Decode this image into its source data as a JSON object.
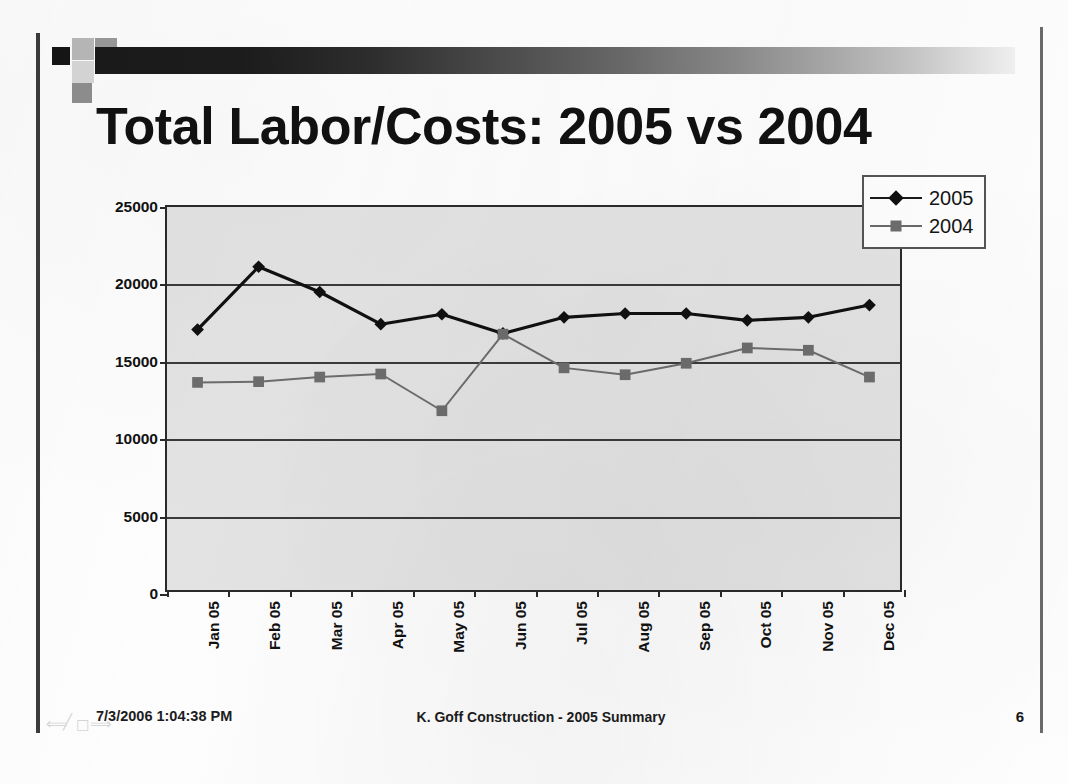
{
  "slide": {
    "title": "Total Labor/Costs: 2005 vs 2004",
    "page_number": "6"
  },
  "footer": {
    "timestamp": "7/3/2006 1:04:38 PM",
    "center_text": "K. Goff Construction - 2005 Summary",
    "nav_icons": [
      "back-arrow-icon",
      "pen-icon",
      "slide-menu-icon",
      "forward-arrow-icon"
    ]
  },
  "legend": {
    "position": "right",
    "entries": [
      {
        "label": "2005",
        "marker": "diamond",
        "color": "#101010"
      },
      {
        "label": "2004",
        "marker": "square",
        "color": "#6d6d6d"
      }
    ]
  },
  "colors": {
    "plot_background": "#e3e3e3",
    "axis": "#2a2a2a",
    "gridline": "#3a3a3a",
    "series_2005": "#101010",
    "series_2004": "#6d6d6d",
    "title": "#111111"
  },
  "chart_data": {
    "type": "line",
    "title": "Total Labor/Costs: 2005 vs 2004",
    "xlabel": "",
    "ylabel": "",
    "ylim": [
      0,
      25000
    ],
    "ytick_labels": [
      "25000",
      "20000",
      "15000",
      "10000",
      "5000",
      "0"
    ],
    "yticks": [
      25000,
      20000,
      15000,
      10000,
      5000,
      0
    ],
    "grid": true,
    "legend_position": "right",
    "categories": [
      "Jan 05",
      "Feb 05",
      "Mar 05",
      "Apr 05",
      "May 05",
      "Jun 05",
      "Jul 05",
      "Aug 05",
      "Sep 05",
      "Oct 05",
      "Nov 05",
      "Dec 05"
    ],
    "series": [
      {
        "name": "2005",
        "marker": "diamond",
        "values": [
          17000,
          21100,
          19450,
          17350,
          18000,
          16750,
          17800,
          18050,
          18050,
          17600,
          17800,
          18600
        ]
      },
      {
        "name": "2004",
        "marker": "square",
        "values": [
          13550,
          13600,
          13900,
          14100,
          11700,
          16700,
          14500,
          14050,
          14800,
          15800,
          15650,
          13900
        ]
      }
    ]
  }
}
